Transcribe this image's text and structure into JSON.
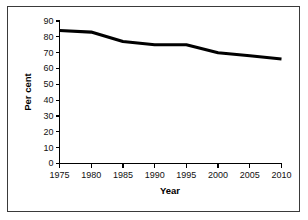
{
  "chart_data": {
    "type": "line",
    "title": "",
    "xlabel": "Year",
    "ylabel": "Per cent",
    "x": [
      1975,
      1980,
      1985,
      1990,
      1994,
      1995,
      2000,
      2005,
      2010
    ],
    "values": [
      84,
      83,
      77,
      75,
      75,
      75,
      70,
      68,
      66
    ],
    "series": [
      {
        "name": "Per cent",
        "x": [
          1975,
          1980,
          1985,
          1990,
          1994,
          1995,
          2000,
          2005,
          2010
        ],
        "values": [
          84,
          83,
          77,
          75,
          75,
          75,
          70,
          68,
          66
        ],
        "color": "#000000"
      }
    ],
    "xlim": [
      1975,
      2010
    ],
    "ylim": [
      0,
      90
    ],
    "xticks": [
      1975,
      1980,
      1985,
      1990,
      1995,
      2000,
      2005,
      2010
    ],
    "yticks": [
      0,
      10,
      20,
      30,
      40,
      50,
      60,
      70,
      80,
      90
    ],
    "xtick_labels": [
      "1975",
      "1980",
      "1985",
      "1990",
      "1995",
      "2000",
      "2005",
      "2010"
    ],
    "ytick_labels": [
      "0",
      "10",
      "20",
      "30",
      "40",
      "50",
      "60",
      "70",
      "80",
      "90"
    ],
    "grid": false,
    "legend": false,
    "legend_position": "none",
    "line_color": "#000000",
    "border_color": "#3a3a3a",
    "background_color": "#ffffff"
  }
}
